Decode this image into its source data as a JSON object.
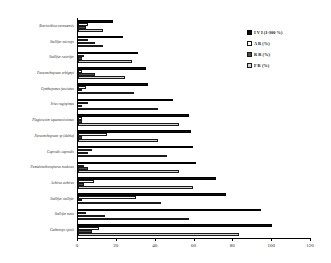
{
  "chart_data": {
    "type": "bar",
    "orientation": "horizontal",
    "title": "",
    "subtitle": "",
    "xlabel": "",
    "ylabel": "",
    "xlim": [
      0,
      120
    ],
    "xticks": [
      0,
      20,
      40,
      60,
      80,
      100,
      120
    ],
    "xtick_labels": [
      "0",
      "20",
      "40",
      "60",
      "80",
      "100",
      "120"
    ],
    "grid": false,
    "legend_position": "top-right",
    "categories": [
      "Botriochloa vermuensis",
      "Stellifer microps",
      "Stellifer rastrifer",
      "Paraonchopsum urbignyi",
      "Cynthoponus fasciatus",
      "Irius rugispinus",
      "Plagioscion squamosissimus",
      "Paraonchopsum sp (dubia)",
      "Caprodis caprodis",
      "Pentalonchoropterus nodosus",
      "Achirus achirus",
      "Stellifer stellifer",
      "Stellifer naso",
      "Cathorops spixii"
    ],
    "series": [
      {
        "name": "I V I (1-300 %)",
        "legend_label": "I V I (1-300 %)",
        "color": "#0b0b0b",
        "values": [
          18,
          23,
          31,
          35,
          36,
          49,
          57,
          58,
          59,
          61,
          71,
          76,
          94,
          100
        ]
      },
      {
        "name": "A R (%)",
        "legend_label": "A R (%)",
        "color": "#ffffff",
        "values": [
          5,
          5,
          3,
          2,
          4,
          5,
          2,
          15,
          7,
          3,
          8,
          30,
          4,
          11
        ]
      },
      {
        "name": "R R (%)",
        "legend_label": "R R (%)",
        "color": "#4d4d4d",
        "values": [
          4,
          9,
          2,
          9,
          2,
          2,
          2,
          2,
          5,
          5,
          3,
          2,
          14,
          7
        ]
      },
      {
        "name": "F R (%)",
        "legend_label": "F R (%)",
        "color": "#d4d4d4",
        "values": [
          13,
          13,
          28,
          24,
          29,
          41,
          52,
          41,
          46,
          52,
          59,
          43,
          57,
          83
        ]
      }
    ]
  }
}
